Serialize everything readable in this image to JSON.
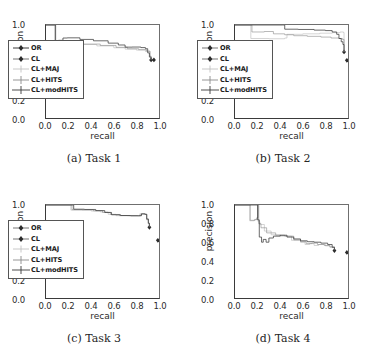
{
  "figure": {
    "panels": [
      {
        "id": "a",
        "caption": "(a) Task 1",
        "xlabel": "recall",
        "ylabel": "precision"
      },
      {
        "id": "b",
        "caption": "(b) Task 2",
        "xlabel": "recall",
        "ylabel": "precision"
      },
      {
        "id": "c",
        "caption": "(c) Task 3",
        "xlabel": "recall",
        "ylabel": "precision"
      },
      {
        "id": "d",
        "caption": "(d) Task 4",
        "xlabel": "recall",
        "ylabel": "precision"
      }
    ],
    "xticks": [
      "0.0",
      "0.2",
      "0.4",
      "0.6",
      "0.8",
      "1.0"
    ],
    "yticks": [
      "0.0",
      "0.2",
      "0.4",
      "0.6",
      "0.8",
      "1.0"
    ],
    "legend": [
      {
        "label": "OR",
        "marker": "diamond",
        "color": "#3a3a3a"
      },
      {
        "label": "CL",
        "marker": "diamond",
        "color": "#3a3a3a"
      },
      {
        "label": "CL+MAJ",
        "marker": "plus",
        "color": "#b9b9b9"
      },
      {
        "label": "CL+HITS",
        "marker": "plus",
        "color": "#8a8a8a"
      },
      {
        "label": "CL+modHITS",
        "marker": "plus",
        "color": "#3a3a3a"
      }
    ]
  },
  "chart_data": [
    {
      "type": "line",
      "id": "a",
      "title": "(a) Task 1",
      "xlabel": "recall",
      "ylabel": "precision",
      "xlim": [
        0.0,
        1.0
      ],
      "ylim": [
        0.0,
        1.0
      ],
      "grid": false,
      "legend_position": "lower-left",
      "series": [
        {
          "name": "OR",
          "marker": "diamond",
          "color": "#3a3a3a",
          "points": [
            [
              0.93,
              0.625
            ]
          ]
        },
        {
          "name": "CL",
          "marker": "diamond",
          "color": "#3a3a3a",
          "points": [
            [
              0.955,
              0.625
            ]
          ]
        },
        {
          "name": "CL+MAJ",
          "color": "#b9b9b9",
          "points": [
            [
              0.0,
              1.0
            ],
            [
              0.07,
              1.0
            ],
            [
              0.08,
              0.8
            ],
            [
              0.12,
              0.795
            ],
            [
              0.16,
              0.8
            ],
            [
              0.3,
              0.79
            ],
            [
              0.45,
              0.775
            ],
            [
              0.6,
              0.755
            ],
            [
              0.7,
              0.74
            ],
            [
              0.8,
              0.73
            ],
            [
              0.88,
              0.715
            ],
            [
              0.92,
              0.66
            ],
            [
              0.93,
              0.625
            ]
          ]
        },
        {
          "name": "CL+HITS",
          "color": "#8a8a8a",
          "points": [
            [
              0.0,
              1.0
            ],
            [
              0.07,
              1.0
            ],
            [
              0.08,
              0.805
            ],
            [
              0.13,
              0.8
            ],
            [
              0.18,
              0.805
            ],
            [
              0.32,
              0.795
            ],
            [
              0.48,
              0.78
            ],
            [
              0.62,
              0.76
            ],
            [
              0.72,
              0.745
            ],
            [
              0.82,
              0.735
            ],
            [
              0.89,
              0.72
            ],
            [
              0.92,
              0.665
            ],
            [
              0.93,
              0.63
            ]
          ]
        },
        {
          "name": "CL+modHITS",
          "color": "#3a3a3a",
          "points": [
            [
              0.0,
              1.0
            ],
            [
              0.075,
              1.0
            ],
            [
              0.085,
              0.82
            ],
            [
              0.11,
              0.835
            ],
            [
              0.15,
              0.86
            ],
            [
              0.19,
              0.862
            ],
            [
              0.3,
              0.845
            ],
            [
              0.42,
              0.83
            ],
            [
              0.55,
              0.805
            ],
            [
              0.64,
              0.785
            ],
            [
              0.7,
              0.762
            ],
            [
              0.76,
              0.763
            ],
            [
              0.84,
              0.757
            ],
            [
              0.88,
              0.745
            ],
            [
              0.9,
              0.7
            ],
            [
              0.915,
              0.655
            ],
            [
              0.93,
              0.628
            ]
          ]
        }
      ]
    },
    {
      "type": "line",
      "id": "b",
      "title": "(b) Task 2",
      "xlabel": "recall",
      "ylabel": "precision",
      "xlim": [
        0.0,
        1.0
      ],
      "ylim": [
        0.0,
        1.0
      ],
      "grid": false,
      "legend_position": "lower-left",
      "series": [
        {
          "name": "OR",
          "marker": "diamond",
          "color": "#3a3a3a",
          "points": [
            [
              0.965,
              0.71
            ]
          ]
        },
        {
          "name": "CL",
          "marker": "diamond",
          "color": "#3a3a3a",
          "points": [
            [
              0.99,
              0.62
            ]
          ]
        },
        {
          "name": "CL+MAJ",
          "color": "#b9b9b9",
          "points": [
            [
              0.0,
              1.0
            ],
            [
              0.12,
              1.0
            ],
            [
              0.14,
              0.855
            ],
            [
              0.3,
              0.852
            ],
            [
              0.44,
              0.86
            ],
            [
              0.46,
              0.9
            ],
            [
              0.6,
              0.905
            ],
            [
              0.75,
              0.912
            ],
            [
              0.86,
              0.918
            ],
            [
              0.93,
              0.925
            ],
            [
              0.96,
              0.92
            ],
            [
              0.965,
              0.71
            ]
          ]
        },
        {
          "name": "CL+HITS",
          "color": "#8a8a8a",
          "points": [
            [
              0.0,
              1.0
            ],
            [
              0.13,
              1.0
            ],
            [
              0.15,
              0.925
            ],
            [
              0.26,
              0.93
            ],
            [
              0.34,
              0.905
            ],
            [
              0.44,
              0.895
            ],
            [
              0.52,
              0.885
            ],
            [
              0.64,
              0.878
            ],
            [
              0.76,
              0.87
            ],
            [
              0.85,
              0.86
            ],
            [
              0.92,
              0.855
            ],
            [
              0.95,
              0.845
            ],
            [
              0.965,
              0.71
            ]
          ]
        },
        {
          "name": "CL+modHITS",
          "color": "#3a3a3a",
          "points": [
            [
              0.0,
              1.0
            ],
            [
              0.42,
              1.0
            ],
            [
              0.44,
              0.955
            ],
            [
              0.56,
              0.952
            ],
            [
              0.7,
              0.945
            ],
            [
              0.8,
              0.94
            ],
            [
              0.86,
              0.925
            ],
            [
              0.9,
              0.9
            ],
            [
              0.92,
              0.855
            ],
            [
              0.94,
              0.82
            ],
            [
              0.955,
              0.79
            ],
            [
              0.965,
              0.715
            ]
          ]
        }
      ]
    },
    {
      "type": "line",
      "id": "c",
      "title": "(c) Task 3",
      "xlabel": "recall",
      "ylabel": "precision",
      "xlim": [
        0.0,
        1.0
      ],
      "ylim": [
        0.0,
        1.0
      ],
      "grid": false,
      "legend_position": "lower-left",
      "series": [
        {
          "name": "OR",
          "marker": "diamond",
          "color": "#3a3a3a",
          "points": [
            [
              0.915,
              0.76
            ]
          ]
        },
        {
          "name": "CL",
          "marker": "diamond",
          "color": "#3a3a3a",
          "points": [
            [
              0.99,
              0.62
            ]
          ]
        },
        {
          "name": "CL+MAJ",
          "color": "#b9b9b9",
          "points": [
            [
              0.0,
              1.0
            ],
            [
              0.2,
              1.0
            ],
            [
              0.22,
              0.945
            ],
            [
              0.3,
              0.945
            ],
            [
              0.4,
              0.935
            ],
            [
              0.48,
              0.925
            ],
            [
              0.55,
              0.9
            ],
            [
              0.62,
              0.885
            ],
            [
              0.72,
              0.883
            ],
            [
              0.8,
              0.882
            ],
            [
              0.83,
              0.905
            ],
            [
              0.87,
              0.9
            ],
            [
              0.89,
              0.84
            ],
            [
              0.905,
              0.8
            ],
            [
              0.915,
              0.765
            ]
          ]
        },
        {
          "name": "CL+HITS",
          "color": "#8a8a8a",
          "points": [
            [
              0.0,
              1.0
            ],
            [
              0.21,
              1.0
            ],
            [
              0.23,
              0.95
            ],
            [
              0.32,
              0.948
            ],
            [
              0.42,
              0.938
            ],
            [
              0.5,
              0.92
            ],
            [
              0.57,
              0.898
            ],
            [
              0.65,
              0.886
            ],
            [
              0.74,
              0.884
            ],
            [
              0.81,
              0.884
            ],
            [
              0.84,
              0.903
            ],
            [
              0.875,
              0.898
            ],
            [
              0.89,
              0.845
            ],
            [
              0.905,
              0.8
            ],
            [
              0.915,
              0.762
            ]
          ]
        },
        {
          "name": "CL+modHITS",
          "color": "#3a3a3a",
          "points": [
            [
              0.0,
              1.0
            ],
            [
              0.22,
              1.0
            ],
            [
              0.245,
              0.955
            ],
            [
              0.34,
              0.952
            ],
            [
              0.44,
              0.94
            ],
            [
              0.52,
              0.92
            ],
            [
              0.58,
              0.895
            ],
            [
              0.66,
              0.887
            ],
            [
              0.75,
              0.885
            ],
            [
              0.82,
              0.885
            ],
            [
              0.845,
              0.905
            ],
            [
              0.878,
              0.9
            ],
            [
              0.892,
              0.85
            ],
            [
              0.906,
              0.805
            ],
            [
              0.915,
              0.765
            ]
          ]
        }
      ]
    },
    {
      "type": "line",
      "id": "d",
      "title": "(d) Task 4",
      "xlabel": "recall",
      "ylabel": "precision",
      "xlim": [
        0.0,
        1.0
      ],
      "ylim": [
        0.0,
        1.0
      ],
      "grid": false,
      "legend_position": "none",
      "series": [
        {
          "name": "OR",
          "marker": "diamond",
          "color": "#3a3a3a",
          "points": [
            [
              0.88,
              0.51
            ]
          ]
        },
        {
          "name": "CL",
          "marker": "diamond",
          "color": "#3a3a3a",
          "points": [
            [
              0.99,
              0.49
            ]
          ]
        },
        {
          "name": "CL+MAJ",
          "color": "#b9b9b9",
          "points": [
            [
              0.0,
              1.0
            ],
            [
              0.12,
              1.0
            ],
            [
              0.13,
              0.83
            ],
            [
              0.17,
              0.84
            ],
            [
              0.19,
              0.86
            ],
            [
              0.2,
              1.0
            ],
            [
              0.205,
              0.82
            ],
            [
              0.22,
              0.79
            ],
            [
              0.26,
              0.72
            ],
            [
              0.32,
              0.68
            ],
            [
              0.4,
              0.665
            ],
            [
              0.5,
              0.62
            ],
            [
              0.58,
              0.6
            ],
            [
              0.62,
              0.575
            ],
            [
              0.66,
              0.585
            ],
            [
              0.7,
              0.565
            ],
            [
              0.74,
              0.575
            ],
            [
              0.8,
              0.56
            ],
            [
              0.84,
              0.545
            ],
            [
              0.88,
              0.515
            ]
          ]
        },
        {
          "name": "CL+HITS",
          "color": "#8a8a8a",
          "points": [
            [
              0.0,
              1.0
            ],
            [
              0.125,
              1.0
            ],
            [
              0.135,
              0.835
            ],
            [
              0.175,
              0.845
            ],
            [
              0.195,
              0.865
            ],
            [
              0.205,
              1.0
            ],
            [
              0.21,
              0.8
            ],
            [
              0.23,
              0.755
            ],
            [
              0.28,
              0.7
            ],
            [
              0.36,
              0.675
            ],
            [
              0.44,
              0.665
            ],
            [
              0.52,
              0.625
            ],
            [
              0.58,
              0.605
            ],
            [
              0.63,
              0.585
            ],
            [
              0.68,
              0.59
            ],
            [
              0.73,
              0.575
            ],
            [
              0.79,
              0.565
            ],
            [
              0.84,
              0.55
            ],
            [
              0.88,
              0.515
            ]
          ]
        },
        {
          "name": "CL+modHITS",
          "color": "#3a3a3a",
          "points": [
            [
              0.0,
              1.0
            ],
            [
              0.195,
              1.0
            ],
            [
              0.2,
              0.84
            ],
            [
              0.215,
              0.655
            ],
            [
              0.235,
              0.6
            ],
            [
              0.25,
              0.63
            ],
            [
              0.275,
              0.6
            ],
            [
              0.3,
              0.645
            ],
            [
              0.34,
              0.665
            ],
            [
              0.4,
              0.675
            ],
            [
              0.46,
              0.655
            ],
            [
              0.52,
              0.635
            ],
            [
              0.58,
              0.615
            ],
            [
              0.64,
              0.605
            ],
            [
              0.7,
              0.6
            ],
            [
              0.76,
              0.59
            ],
            [
              0.82,
              0.575
            ],
            [
              0.86,
              0.545
            ],
            [
              0.88,
              0.515
            ]
          ]
        }
      ]
    }
  ]
}
